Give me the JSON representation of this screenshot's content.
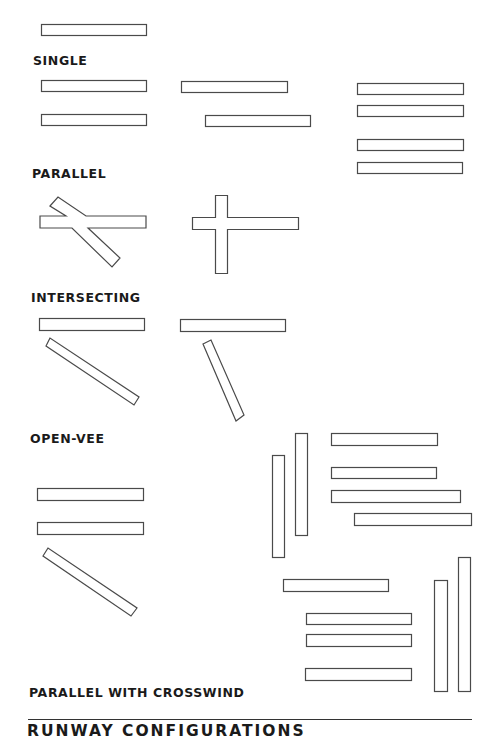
{
  "diagram": {
    "title": "RUNWAY CONFIGURATIONS",
    "labels": {
      "single": "SINGLE",
      "parallel": "PARALLEL",
      "intersecting": "INTERSECTING",
      "open_vee": "OPEN-VEE",
      "parallel_crosswind": "PARALLEL WITH CROSSWIND"
    },
    "colors": {
      "stroke": "#4a4a4a",
      "text": "#1a1a1a",
      "background": "#ffffff"
    },
    "configurations": [
      {
        "name": "single",
        "runway_count": 1
      },
      {
        "name": "parallel",
        "variants": [
          2,
          2,
          4
        ]
      },
      {
        "name": "intersecting",
        "variants": [
          "angled cross",
          "perpendicular cross"
        ]
      },
      {
        "name": "open-vee",
        "variants": [
          "diverging left",
          "diverging right"
        ]
      },
      {
        "name": "parallel with crosswind",
        "variants": 3
      }
    ]
  }
}
